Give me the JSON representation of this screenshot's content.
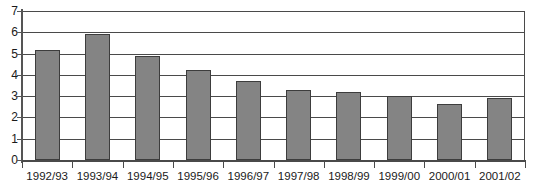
{
  "chart_data": {
    "type": "bar",
    "title": "",
    "subtitle": "",
    "xlabel": "",
    "ylabel": "",
    "categories": [
      "1992/93",
      "1993/94",
      "1994/95",
      "1995/96",
      "1996/97",
      "1997/98",
      "1998/99",
      "1999/00",
      "2000/01",
      "2001/02"
    ],
    "values": [
      5.15,
      5.9,
      4.9,
      4.25,
      3.7,
      3.3,
      3.2,
      3.0,
      2.65,
      2.9
    ],
    "ylim": [
      0,
      7
    ],
    "ytick_labels": [
      "0",
      "1",
      "2",
      "3",
      "4",
      "5",
      "6",
      "7"
    ],
    "ytick_values": [
      0,
      1,
      2,
      3,
      4,
      5,
      6,
      7
    ],
    "grid": true,
    "grid_axis": "y",
    "legend": false,
    "legend_position": "none",
    "bar_fill_color": "#848484",
    "bar_edge_color": "#3d3d3d",
    "axis_color": "#4a4a4a",
    "background_color": "#ffffff",
    "text_color": "#1a1a1a"
  }
}
